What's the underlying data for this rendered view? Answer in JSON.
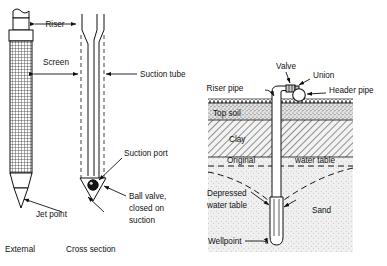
{
  "figure": {
    "background_color": "#ffffff",
    "line_color": "#111111"
  },
  "left_panel": {
    "captions": [
      {
        "key": "external",
        "text": "External"
      },
      {
        "key": "cross_section",
        "text": "Cross section"
      }
    ],
    "labels": [
      {
        "key": "riser",
        "text": "Riser"
      },
      {
        "key": "screen",
        "text": "Screen"
      },
      {
        "key": "suction_tube",
        "text": "Suction tube"
      },
      {
        "key": "suction_port",
        "text": "Suction port"
      },
      {
        "key": "jet_point",
        "text": "Jet point"
      }
    ],
    "ball_valve_label": {
      "line1": "Ball valve,",
      "line2": "closed on",
      "line3": "suction"
    }
  },
  "right_panel": {
    "labels": [
      {
        "key": "valve",
        "text": "Valve"
      },
      {
        "key": "union",
        "text": "Union"
      },
      {
        "key": "riser_pipe",
        "text": "Riser pipe"
      },
      {
        "key": "header_pipe",
        "text": "Header pipe"
      },
      {
        "key": "wellpoint",
        "text": "Wellpoint"
      }
    ],
    "strata": [
      {
        "key": "top_soil",
        "text": "Top soil",
        "fill": "#d9d9d9"
      },
      {
        "key": "clay",
        "text": "Clay",
        "fill": "#e8e8e8"
      },
      {
        "key": "sand",
        "text": "Sand",
        "fill": "#ededed"
      }
    ],
    "water_tables": {
      "original_left": "Original",
      "original_right": "water table",
      "depressed_line1": "Depressed",
      "depressed_line2": "water table"
    }
  }
}
